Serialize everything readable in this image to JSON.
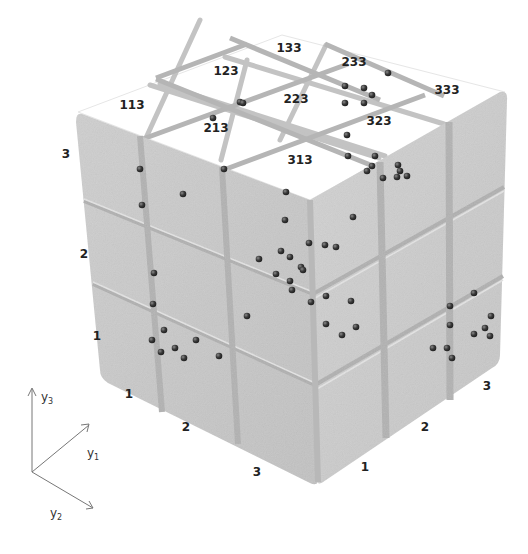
{
  "diagram": {
    "colors": {
      "face_fill": "#c9c9c9",
      "face_fill_dark": "#bdbdbd",
      "top_fill": "#ffffff",
      "groove": "#a8a8a8",
      "dot": "#3a3a3a",
      "label": "#222222"
    },
    "top_cells": [
      {
        "label": "113",
        "x": 132,
        "y": 109
      },
      {
        "label": "123",
        "x": 226,
        "y": 75
      },
      {
        "label": "133",
        "x": 289,
        "y": 52
      },
      {
        "label": "213",
        "x": 216,
        "y": 132
      },
      {
        "label": "223",
        "x": 296,
        "y": 103
      },
      {
        "label": "233",
        "x": 354,
        "y": 66
      },
      {
        "label": "313",
        "x": 300,
        "y": 164
      },
      {
        "label": "323",
        "x": 379,
        "y": 125
      },
      {
        "label": "333",
        "x": 447,
        "y": 94
      }
    ],
    "y3_labels": [
      {
        "label": "3",
        "x": 66,
        "y": 158
      },
      {
        "label": "2",
        "x": 84,
        "y": 258
      },
      {
        "label": "1",
        "x": 97,
        "y": 340
      }
    ],
    "y1_labels": [
      {
        "label": "1",
        "x": 129,
        "y": 398
      },
      {
        "label": "2",
        "x": 186,
        "y": 431
      },
      {
        "label": "3",
        "x": 257,
        "y": 476
      }
    ],
    "y2_labels": [
      {
        "label": "1",
        "x": 365,
        "y": 471
      },
      {
        "label": "2",
        "x": 425,
        "y": 431
      },
      {
        "label": "3",
        "x": 487,
        "y": 390
      }
    ],
    "axes": {
      "y1": {
        "name": "y",
        "sub": "1"
      },
      "y2": {
        "name": "y",
        "sub": "2"
      },
      "y3": {
        "name": "y",
        "sub": "3"
      }
    },
    "points": [
      [
        240,
        102
      ],
      [
        243,
        103
      ],
      [
        213,
        118
      ],
      [
        388,
        73
      ],
      [
        345,
        86
      ],
      [
        345,
        103
      ],
      [
        364,
        88
      ],
      [
        372,
        95
      ],
      [
        364,
        103
      ],
      [
        347,
        135
      ],
      [
        348,
        156
      ],
      [
        375,
        156
      ],
      [
        140,
        169
      ],
      [
        224,
        169
      ],
      [
        286,
        192
      ],
      [
        183,
        194
      ],
      [
        142,
        205
      ],
      [
        372,
        166
      ],
      [
        367,
        171
      ],
      [
        383,
        178
      ],
      [
        398,
        165
      ],
      [
        400,
        171
      ],
      [
        397,
        177
      ],
      [
        407,
        176
      ],
      [
        353,
        217
      ],
      [
        285,
        220
      ],
      [
        309,
        243
      ],
      [
        336,
        247
      ],
      [
        281,
        251
      ],
      [
        290,
        257
      ],
      [
        301,
        267
      ],
      [
        325,
        245
      ],
      [
        290,
        281
      ],
      [
        259,
        259
      ],
      [
        276,
        274
      ],
      [
        303,
        270
      ],
      [
        292,
        290
      ],
      [
        311,
        302
      ],
      [
        154,
        273
      ],
      [
        153,
        304
      ],
      [
        164,
        330
      ],
      [
        152,
        340
      ],
      [
        161,
        352
      ],
      [
        175,
        348
      ],
      [
        184,
        358
      ],
      [
        196,
        340
      ],
      [
        219,
        356
      ],
      [
        247,
        316
      ],
      [
        326,
        296
      ],
      [
        351,
        301
      ],
      [
        356,
        327
      ],
      [
        326,
        324
      ],
      [
        342,
        335
      ],
      [
        474,
        293
      ],
      [
        450,
        306
      ],
      [
        450,
        325
      ],
      [
        447,
        348
      ],
      [
        491,
        316
      ],
      [
        474,
        334
      ],
      [
        433,
        348
      ],
      [
        452,
        358
      ],
      [
        485,
        328
      ],
      [
        490,
        336
      ]
    ]
  }
}
